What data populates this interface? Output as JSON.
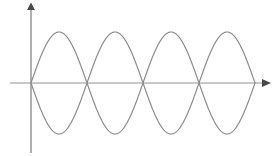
{
  "figure": {
    "canvas": {
      "width": 279,
      "height": 156,
      "background": "#ffffff"
    }
  },
  "axes": {
    "x_axis": {
      "name": "horizontal axis",
      "color": "#c8c8c8",
      "stroke_width": 2,
      "y": 83,
      "x_start": 10,
      "x_end": 262,
      "arrow": {
        "name": "arrowhead-right",
        "x": 262,
        "y": 83,
        "size": 5,
        "color": "#4a4a4a"
      }
    },
    "y_axis": {
      "name": "vertical axis",
      "color": "#b0b0b0",
      "stroke_width": 2,
      "x": 31,
      "y_top": 9,
      "y_bottom": 153,
      "arrow": {
        "name": "arrowhead-up",
        "x": 31,
        "y": 9,
        "size": 5,
        "color": "#4a4a4a"
      }
    }
  },
  "chart_data": {
    "type": "line",
    "xlabel": "",
    "ylabel": "",
    "grid": false,
    "legend": null,
    "xlim": [
      31,
      255
    ],
    "ylim": [
      -1,
      1
    ],
    "origin_px": {
      "x": 31,
      "y": 83
    },
    "amplitude_px": 51,
    "wavelength_px": 112,
    "half_period_px": 56,
    "cycles": 2,
    "antinode_count": 4,
    "node_x_px": [
      31,
      87,
      143,
      199,
      255
    ],
    "peak_x_px": [
      59,
      115,
      171,
      227
    ],
    "peak_y_px": 32,
    "trough_y_px": 136,
    "series": [
      {
        "name": "sine wave",
        "phase": 0,
        "sign": 1,
        "color": "#8c8c8c",
        "stroke_width": 1.2,
        "x": [
          31,
          59,
          87,
          115,
          143,
          171,
          199,
          227,
          255
        ],
        "values": [
          0,
          1,
          0,
          -1,
          0,
          1,
          0,
          -1,
          0
        ]
      },
      {
        "name": "inverted sine wave",
        "phase": 0,
        "sign": -1,
        "color": "#8c8c8c",
        "stroke_width": 1.2,
        "x": [
          31,
          59,
          87,
          115,
          143,
          171,
          199,
          227,
          255
        ],
        "values": [
          0,
          -1,
          0,
          1,
          0,
          -1,
          0,
          1,
          0
        ]
      }
    ]
  }
}
